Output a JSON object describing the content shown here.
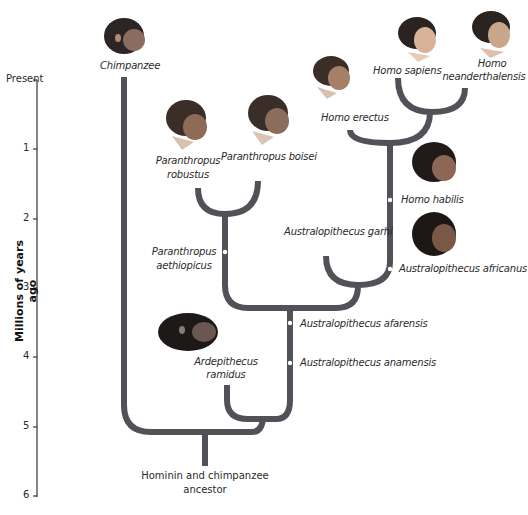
{
  "diagram": {
    "type": "phylogenetic-tree",
    "axis": {
      "title": "Millions of years ago",
      "ticks": [
        "Present",
        "1",
        "2",
        "3",
        "4",
        "5",
        "6"
      ]
    },
    "root_label_line1": "Hominin and chimpanzee",
    "root_label_line2": "ancestor",
    "colors": {
      "branch": "#505258",
      "dot": "#ffffff",
      "axis": "#333333"
    },
    "species": {
      "chimpanzee": "Chimpanzee",
      "homo_sapiens": "Homo sapiens",
      "homo_neanderthalensis_1": "Homo",
      "homo_neanderthalensis_2": "neanderthalensis",
      "homo_erectus": "Homo erectus",
      "paranthropus_robustus_1": "Paranthropus",
      "paranthropus_robustus_2": "robustus",
      "paranthropus_boisei": "Paranthropus boisei",
      "homo_habilis": "Homo habilis",
      "australopithecus_garhi": "Australopithecus garhi",
      "paranthropus_aethiopicus_1": "Paranthropus",
      "paranthropus_aethiopicus_2": "aethiopicus",
      "australopithecus_africanus": "Australopithecus africanus",
      "australopithecus_afarensis": "Australopithecus afarensis",
      "australopithecus_anamensis": "Australopithecus anamensis",
      "ardipithecus_ramidus_1": "Ardepithecus",
      "ardipithecus_ramidus_2": "ramidus"
    },
    "heads": [
      "chimpanzee-head",
      "homo-sapiens-head",
      "homo-neanderthalensis-head",
      "homo-erectus-head",
      "paranthropus-robustus-head",
      "paranthropus-boisei-head",
      "homo-habilis-head",
      "australopithecus-africanus-head",
      "ardipithecus-ramidus-head"
    ]
  }
}
